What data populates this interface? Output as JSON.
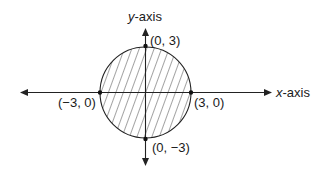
{
  "diagram": {
    "type": "shaded-circle-on-axes",
    "axes": {
      "x_label_var": "x",
      "x_label_suffix": "-axis",
      "y_label_var": "y",
      "y_label_suffix": "-axis"
    },
    "circle": {
      "center": [
        0,
        0
      ],
      "radius": 3,
      "shaded": true,
      "shading": "diagonal-hatch"
    },
    "points": [
      {
        "coords": [
          0,
          3
        ],
        "label": "(0, 3)"
      },
      {
        "coords": [
          3,
          0
        ],
        "label": "(3, 0)"
      },
      {
        "coords": [
          0,
          -3
        ],
        "label": "(0, −3)"
      },
      {
        "coords": [
          -3,
          0
        ],
        "label": "(−3, 0)"
      }
    ],
    "colors": {
      "stroke": "#222222",
      "background": "#ffffff"
    }
  }
}
